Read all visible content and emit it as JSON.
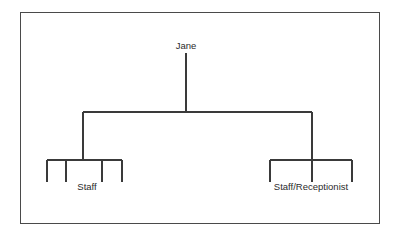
{
  "diagram": {
    "type": "org-chart",
    "title": "",
    "frame": {
      "x": 20,
      "y": 12,
      "width": 359,
      "height": 211,
      "stroke": "#4a4a4a",
      "stroke_width": 1,
      "fill": "#ffffff"
    },
    "style": {
      "line_color": "#3a3a3a",
      "line_width": 1.2,
      "text_color": "#2b2b2b",
      "background": "#ffffff",
      "font_size_px": 9.5
    },
    "root": {
      "id": "root",
      "label": "Jane",
      "label_x": 186,
      "label_y": 49,
      "stem": {
        "x": 186,
        "y1": 53,
        "y2": 112
      }
    },
    "trunk_bar": {
      "y": 112,
      "x1": 83,
      "x2": 312
    },
    "branches": [
      {
        "id": "left-branch",
        "drop": {
          "x": 83,
          "y1": 112,
          "y2": 160
        },
        "bar": {
          "y": 160,
          "x1": 47,
          "x2": 122
        },
        "stub_length": 22,
        "stub_positions": [
          47,
          66,
          102,
          122
        ],
        "label": "Staff",
        "label_x": 87,
        "label_y": 190,
        "child_count": 4
      },
      {
        "id": "right-branch",
        "drop": {
          "x": 312,
          "y1": 112,
          "y2": 160
        },
        "bar": {
          "y": 160,
          "x1": 270,
          "x2": 352
        },
        "stub_length": 22,
        "stub_positions": [
          270,
          312,
          352
        ],
        "label": "Staff/Receptionist",
        "label_x": 311,
        "label_y": 190,
        "child_count": 3
      }
    ]
  }
}
